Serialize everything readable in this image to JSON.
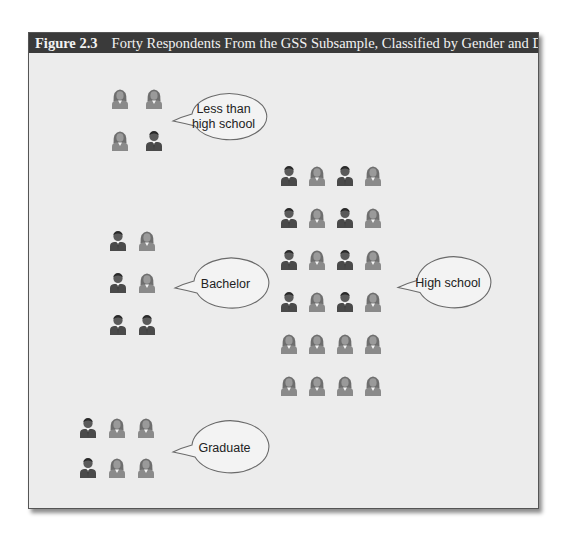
{
  "figure": {
    "number": "Figure 2.3",
    "title": "Forty Respondents From the GSS Subsample, Classified by Gender and Degree"
  },
  "colors": {
    "male": "#4a4a4a",
    "female": "#8a8a8a",
    "header_bg": "#3a3a3a",
    "box_bg": "#ececec"
  },
  "groups": [
    {
      "label": "Less than high school",
      "label_lines": [
        "Less than",
        "high school"
      ],
      "grid": [
        [
          "F",
          "F"
        ],
        [
          "F",
          "M"
        ]
      ],
      "count": 4
    },
    {
      "label": "Bachelor",
      "label_lines": [
        "Bachelor"
      ],
      "grid": [
        [
          "M",
          "F"
        ],
        [
          "M",
          "F"
        ],
        [
          "M",
          "M"
        ]
      ],
      "count": 6
    },
    {
      "label": "Graduate",
      "label_lines": [
        "Graduate"
      ],
      "grid": [
        [
          "M",
          "F",
          "F"
        ],
        [
          "M",
          "F",
          "F"
        ]
      ],
      "count": 6
    },
    {
      "label": "High school",
      "label_lines": [
        "High school"
      ],
      "grid": [
        [
          "M",
          "F",
          "M",
          "F"
        ],
        [
          "M",
          "F",
          "M",
          "F"
        ],
        [
          "M",
          "F",
          "M",
          "F"
        ],
        [
          "M",
          "F",
          "M",
          "F"
        ],
        [
          "F",
          "F",
          "F",
          "F"
        ],
        [
          "F",
          "F",
          "F",
          "F"
        ]
      ],
      "count": 24
    }
  ],
  "legend": {
    "M": "male-icon",
    "F": "female-icon"
  },
  "total_respondents": 40
}
